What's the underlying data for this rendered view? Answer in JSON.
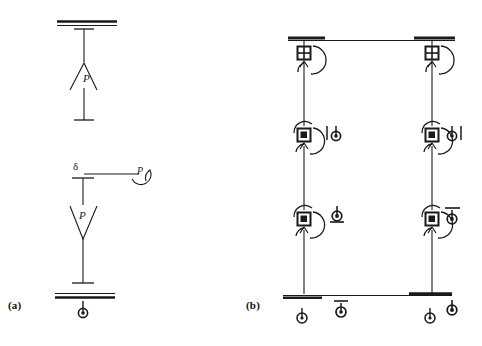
{
  "figure": {
    "kind": "hand-drawn structural engineering sketch",
    "background_color": "#ffffff",
    "ink_color": "#1a1a1a",
    "width": 482,
    "height": 346
  },
  "captions": {
    "panel_a": "(a)",
    "panel_b": "(b)"
  },
  "panel_a": {
    "name": "single-column P-delta sketch",
    "top_member": {
      "name": "fixed-support-top",
      "symbol": "thick double horizontal line"
    },
    "upper_column": {
      "name": "upper-column-segment",
      "end_caps": "short horizontal tee bars at both ends"
    },
    "upper_force": {
      "label": "P",
      "symbol": "up-arrow-head",
      "direction": "up"
    },
    "displacement_label": {
      "label": "δ",
      "name": "delta-displacement-label"
    },
    "moment_arrow": {
      "label": "P",
      "symbol": "curved-moment-arrow",
      "name": "applied-moment-P"
    },
    "lower_force": {
      "label": "P",
      "symbol": "down-arrow-head",
      "direction": "down"
    },
    "base_support": {
      "name": "fixed-support-base",
      "symbol": "thick double horizontal line"
    },
    "base_reaction": {
      "name": "base-reaction-symbol",
      "symbol": "ψ"
    }
  },
  "panel_b": {
    "name": "two-column frame with plastic hinges",
    "top_beam": {
      "name": "top-beam",
      "symbol": "horizontal line with thick end pads"
    },
    "bottom_beam": {
      "name": "bottom-beam",
      "symbol": "horizontal line with thick end pads"
    },
    "columns": [
      {
        "name": "left-column",
        "x": 304
      },
      {
        "name": "right-column",
        "x": 432
      }
    ],
    "hinges": [
      {
        "name": "hinge-top-left",
        "glyph": "square-with-cross",
        "x": 304,
        "y": 53
      },
      {
        "name": "hinge-top-right",
        "glyph": "square-with-cross",
        "x": 432,
        "y": 53
      },
      {
        "name": "hinge-mid-left",
        "glyph": "square-with-dot",
        "x": 304,
        "y": 135
      },
      {
        "name": "hinge-mid-right",
        "glyph": "square-with-dot",
        "x": 432,
        "y": 135
      },
      {
        "name": "hinge-low-left",
        "glyph": "square-with-dot",
        "x": 304,
        "y": 219
      },
      {
        "name": "hinge-low-right",
        "glyph": "square-with-dot",
        "x": 432,
        "y": 219
      }
    ],
    "side_labels": [
      {
        "name": "label-mid-left",
        "text": "|ψ",
        "x": 328,
        "y": 134
      },
      {
        "name": "label-mid-right",
        "text": "ψ|",
        "x": 452,
        "y": 134
      },
      {
        "name": "label-low-left",
        "text": "ψ",
        "x": 334,
        "y": 216
      },
      {
        "name": "label-low-right",
        "text": "ψ",
        "x": 452,
        "y": 216
      }
    ],
    "base_labels": [
      {
        "name": "base-label-left-column",
        "text": "ψ",
        "x": 300,
        "y": 318
      },
      {
        "name": "base-label-mid",
        "text": "ψ",
        "x": 340,
        "y": 312
      },
      {
        "name": "base-label-right",
        "text": "ψ",
        "x": 452,
        "y": 310
      },
      {
        "name": "base-label-right-column",
        "text": "ψ",
        "x": 428,
        "y": 318
      }
    ]
  }
}
